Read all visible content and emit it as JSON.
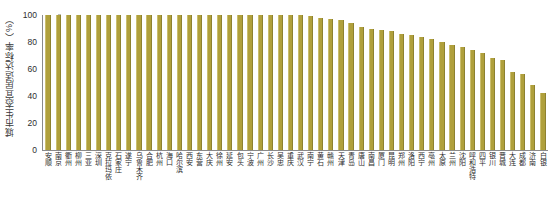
{
  "chart_data": {
    "type": "bar",
    "title": "",
    "xlabel": "",
    "ylabel": "城市生态宜居适达标率（%）",
    "ylim": [
      0,
      100
    ],
    "yticks": [
      0,
      20,
      40,
      60,
      80,
      100
    ],
    "ytick_labels": [
      "0",
      "20",
      "40",
      "60",
      "80",
      "100"
    ],
    "grid": false,
    "legend": "none",
    "bar_color": "#b0a03c",
    "categories": [
      "安顺",
      "南京",
      "衢州",
      "柳州",
      "三亚",
      "深圳",
      "克拉玛依",
      "石家庄",
      "遂宁",
      "乌鲁木齐",
      "合肥",
      "杭州",
      "海口",
      "哈尔滨",
      "西安",
      "东营",
      "大庆",
      "徐州",
      "延安",
      "包头",
      "宁波",
      "广州",
      "长沙",
      "吴忠",
      "重庆",
      "武汉",
      "南宁",
      "黄石",
      "赣州",
      "天津",
      "青岛",
      "唐山",
      "南昌",
      "厦门",
      "昆明",
      "郑州",
      "洛阳",
      "西宁",
      "亳州",
      "太原",
      "兰州",
      "沈阳",
      "呼和浩特",
      "四平",
      "银川",
      "晋城",
      "大连",
      "成都",
      "济南",
      "白银"
    ],
    "values": [
      100,
      100,
      100,
      100,
      100,
      100,
      100,
      100,
      100,
      100,
      100,
      100,
      100,
      100,
      100,
      100,
      100,
      100,
      100,
      100,
      100,
      100,
      100,
      100,
      100,
      100,
      99,
      98,
      97,
      96,
      94,
      91,
      90,
      89,
      88,
      86,
      85,
      84,
      82,
      80,
      78,
      76,
      74,
      72,
      68,
      67,
      58,
      56,
      48,
      42
    ]
  }
}
